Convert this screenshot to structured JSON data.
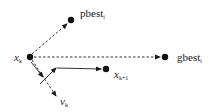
{
  "diagram": {
    "colors": {
      "ink": "#1a1a1a",
      "line": "#333333"
    },
    "nodes": {
      "xk": {
        "label": "x",
        "sub": "k",
        "x": 30,
        "y": 57
      },
      "pbest": {
        "label": "pbest",
        "sub": "i",
        "x": 71,
        "y": 20
      },
      "gbest": {
        "label": "gbest",
        "sub": "i",
        "x": 165,
        "y": 57
      },
      "xk1": {
        "label": "x",
        "sub": "k+1",
        "x": 106,
        "y": 69
      }
    },
    "vectors": {
      "vk": {
        "label": "v",
        "sub": "k"
      }
    },
    "edges": [
      {
        "from": "xk",
        "to": "pbest",
        "style": "dashed",
        "arrow": true
      },
      {
        "from": "xk",
        "to": "gbest",
        "style": "dashed",
        "arrow": true
      },
      {
        "from": "xk",
        "to": "vk",
        "style": "dashed",
        "arrow": true
      },
      {
        "from": "xk",
        "to": "inertia-end",
        "style": "solid",
        "arrow": true
      },
      {
        "from": "inertia-end",
        "to": "xk1",
        "style": "solid",
        "arrow": true
      }
    ]
  }
}
